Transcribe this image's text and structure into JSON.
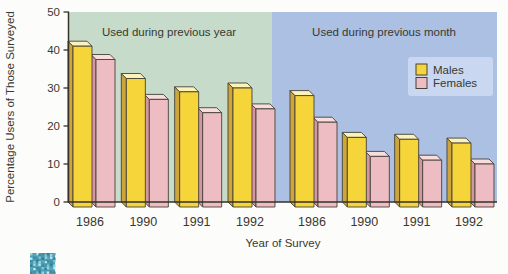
{
  "figure": {
    "type": "3d-bar-chart",
    "corner_icon": "mosaic-thumbnail-icon"
  },
  "chart_data": {
    "type": "bar",
    "title": "",
    "xlabel": "Year of Survey",
    "ylabel": "Percentage Users of Those Surveyed",
    "ylim": [
      0,
      50
    ],
    "yticks": [
      0,
      10,
      20,
      30,
      40,
      50
    ],
    "grid": false,
    "legend_position": "top-right",
    "regions": [
      {
        "key": "previous_year",
        "label": "Used during previous year",
        "bg_color": "#c6dbc9",
        "categories": [
          "1986",
          "1990",
          "1991",
          "1992"
        ]
      },
      {
        "key": "previous_month",
        "label": "Used during previous month",
        "bg_color": "#abc0e2",
        "categories": [
          "1986",
          "1990",
          "1991",
          "1992"
        ]
      }
    ],
    "series": [
      {
        "name": "Males",
        "front_color": "#f5d539",
        "top_color": "#fcf3bb",
        "side_color": "#cda53a",
        "values": {
          "previous_year": [
            41,
            32.5,
            29,
            30
          ],
          "previous_month": [
            28,
            17,
            16.5,
            15.5
          ]
        }
      },
      {
        "name": "Females",
        "front_color": "#eebdc3",
        "top_color": "#f8dddd",
        "side_color": "#d696a1",
        "values": {
          "previous_year": [
            37.5,
            27,
            23.5,
            24.5
          ],
          "previous_month": [
            21,
            12,
            11,
            10
          ]
        }
      }
    ],
    "colors": {
      "outline": "#45423a",
      "axis": "#35322a",
      "text": "#3a382f",
      "legend_panel": "#c9d8f0",
      "icon_base": "#4d9db2",
      "icon_speckles": [
        "#3d8fa6",
        "#7cc4d4",
        "#2e7f96",
        "#9fd4e0",
        "#57a8bc",
        "#c2e4ec",
        "#41889e"
      ]
    }
  }
}
